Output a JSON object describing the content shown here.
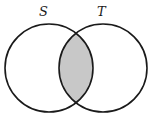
{
  "diagram": {
    "type": "venn",
    "shaded_region": "intersection",
    "sets": [
      {
        "label": "S",
        "cx": 49,
        "cy": 68,
        "r": 44
      },
      {
        "label": "T",
        "cx": 103,
        "cy": 68,
        "r": 44
      }
    ],
    "colors": {
      "stroke": "#1a1a1a",
      "shade": "#c8c8c8",
      "background": "#ffffff"
    }
  }
}
